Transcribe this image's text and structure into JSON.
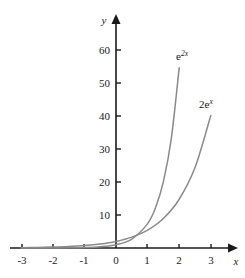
{
  "chart_data": {
    "type": "line",
    "title": "",
    "xlabel": "x",
    "ylabel": "y",
    "xlim": [
      -3.4,
      3.4
    ],
    "ylim": [
      -4,
      66
    ],
    "grid": false,
    "legend_position": "inline-curve-labels",
    "x_ticks": [
      "-3",
      "-2",
      "-1",
      "0",
      "1",
      "2",
      "3"
    ],
    "x_tick_values": [
      -3,
      -2,
      -1,
      0,
      1,
      2,
      3
    ],
    "y_ticks": [
      "10",
      "20",
      "30",
      "40",
      "50",
      "60"
    ],
    "y_tick_values": [
      10,
      20,
      30,
      40,
      50,
      60
    ],
    "series": [
      {
        "name": "e^{2x}",
        "label_base": "e",
        "label_exponent": "2x",
        "color": "#8a8a8a",
        "x_start": -3,
        "x_end": 2.0,
        "values": [
          {
            "x": -3,
            "y": 0.0025
          },
          {
            "x": -2.5,
            "y": 0.0067
          },
          {
            "x": -2,
            "y": 0.018
          },
          {
            "x": -1.5,
            "y": 0.05
          },
          {
            "x": -1,
            "y": 0.135
          },
          {
            "x": -0.5,
            "y": 0.368
          },
          {
            "x": 0,
            "y": 1
          },
          {
            "x": 0.5,
            "y": 2.718
          },
          {
            "x": 1,
            "y": 7.389
          },
          {
            "x": 1.25,
            "y": 12.18
          },
          {
            "x": 1.5,
            "y": 20.09
          },
          {
            "x": 1.75,
            "y": 33.12
          },
          {
            "x": 2,
            "y": 54.6
          }
        ]
      },
      {
        "name": "2e^{x}",
        "label_base": "2e",
        "label_exponent": "x",
        "color": "#8a8a8a",
        "x_start": -3,
        "x_end": 3.0,
        "values": [
          {
            "x": -3,
            "y": 0.0996
          },
          {
            "x": -2.5,
            "y": 0.164
          },
          {
            "x": -2,
            "y": 0.271
          },
          {
            "x": -1.5,
            "y": 0.446
          },
          {
            "x": -1,
            "y": 0.736
          },
          {
            "x": -0.5,
            "y": 1.213
          },
          {
            "x": 0,
            "y": 2
          },
          {
            "x": 0.5,
            "y": 3.297
          },
          {
            "x": 1,
            "y": 5.437
          },
          {
            "x": 1.5,
            "y": 8.963
          },
          {
            "x": 2,
            "y": 14.78
          },
          {
            "x": 2.5,
            "y": 24.36
          },
          {
            "x": 3,
            "y": 40.17
          }
        ]
      }
    ]
  },
  "axes": {
    "y_axis_label": "y",
    "x_axis_label": "x"
  }
}
